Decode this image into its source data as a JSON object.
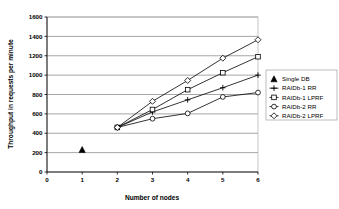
{
  "chart_data": {
    "type": "line",
    "title": "",
    "xlabel": "Number of nodes",
    "ylabel": "Throughput in requests per minute",
    "xlim": [
      0,
      6
    ],
    "ylim": [
      0,
      1600
    ],
    "xticks": [
      "0",
      "1",
      "2",
      "3",
      "4",
      "5",
      "6"
    ],
    "yticks": [
      "0",
      "200",
      "400",
      "600",
      "800",
      "1000",
      "1200",
      "1400",
      "1600"
    ],
    "grid": "horizontal",
    "legend_position": "right",
    "series": [
      {
        "name": "Single DB",
        "marker": "filled-triangle",
        "x": [
          1
        ],
        "values": [
          230
        ]
      },
      {
        "name": "RAIDb-1 RR",
        "marker": "plus",
        "x": [
          2,
          3,
          4,
          5,
          6
        ],
        "values": [
          460,
          620,
          745,
          870,
          1000
        ]
      },
      {
        "name": "RAIDb-1 LPRF",
        "marker": "square",
        "x": [
          2,
          3,
          4,
          5,
          6
        ],
        "values": [
          460,
          645,
          850,
          1025,
          1190
        ]
      },
      {
        "name": "RAIDb-2 RR",
        "marker": "circle",
        "x": [
          2,
          3,
          4,
          5,
          6
        ],
        "values": [
          460,
          550,
          605,
          775,
          820
        ]
      },
      {
        "name": "RAIDb-2 LPRF",
        "marker": "diamond",
        "x": [
          2,
          3,
          4,
          5,
          6
        ],
        "values": [
          460,
          730,
          945,
          1175,
          1365
        ]
      }
    ]
  },
  "colors": {
    "line": "#000000",
    "grid": "#808080",
    "axis": "#000000",
    "background": "#ffffff",
    "legend_border": "#808080"
  }
}
